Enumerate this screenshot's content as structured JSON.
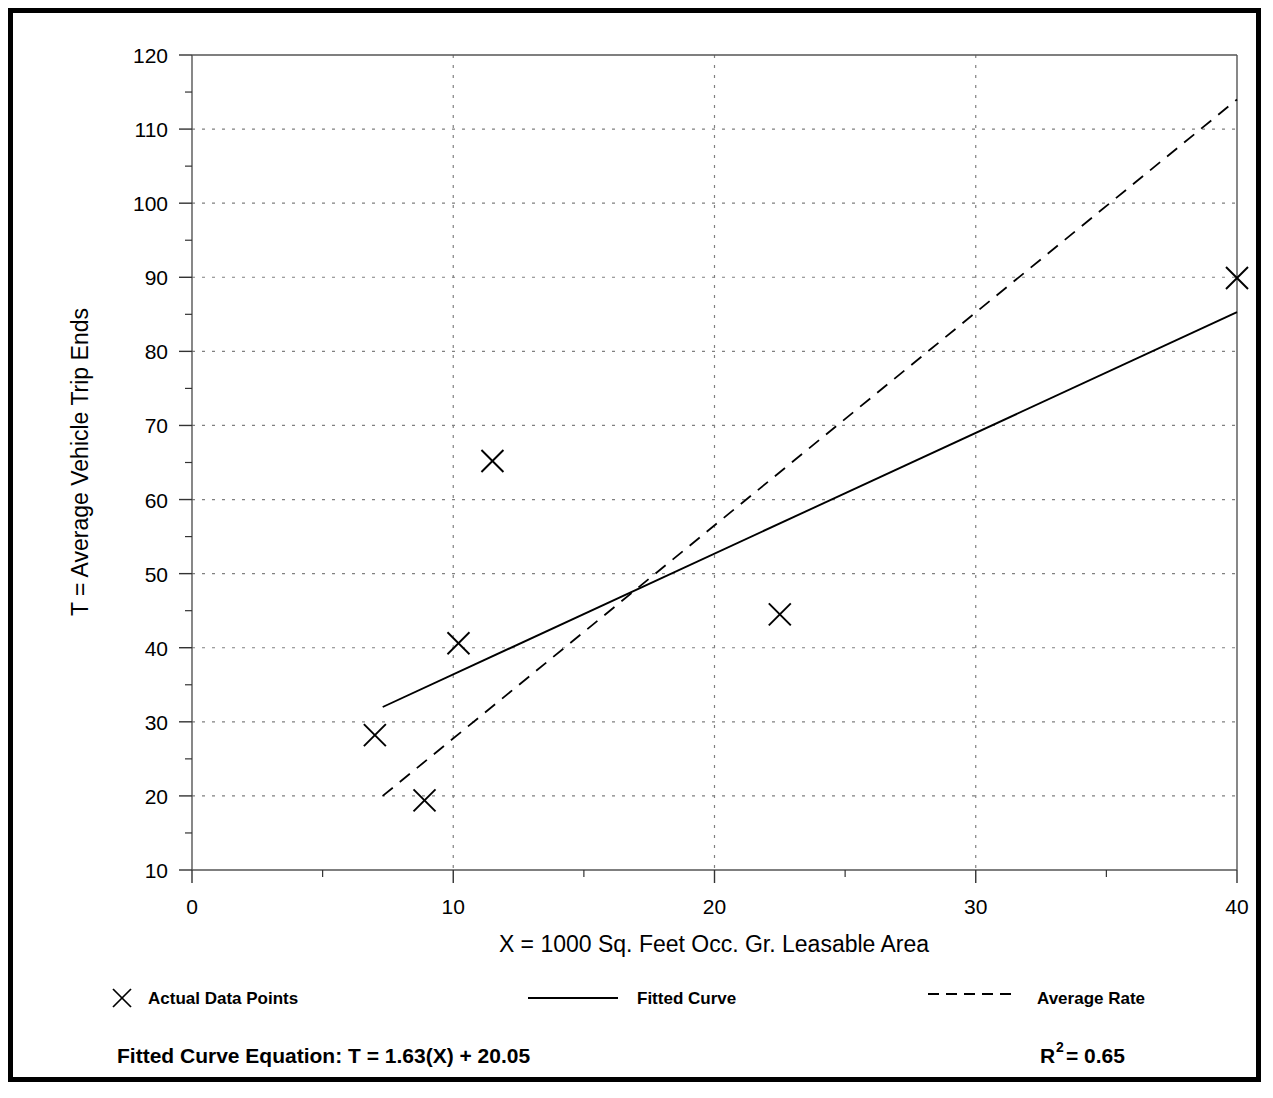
{
  "chart_data": {
    "type": "scatter",
    "title": "",
    "xlabel": "X = 1000 Sq. Feet Occ. Gr. Leasable Area",
    "ylabel": "T = Average Vehicle Trip Ends",
    "xlim": [
      0,
      40
    ],
    "ylim": [
      10,
      120
    ],
    "xticks": [
      0,
      10,
      20,
      30,
      40
    ],
    "xtick_labels": [
      "0",
      "10",
      "20",
      "30",
      "40"
    ],
    "yticks": [
      10,
      20,
      30,
      40,
      50,
      60,
      70,
      80,
      90,
      100,
      110,
      120
    ],
    "ytick_labels": [
      "10",
      "20",
      "30",
      "40",
      "50",
      "60",
      "70",
      "80",
      "90",
      "100",
      "110",
      "120"
    ],
    "y_minor_ticks": [
      15,
      25,
      35,
      45,
      55,
      65,
      75,
      85,
      95,
      105,
      115
    ],
    "x_minor_ticks": [
      5,
      15,
      25,
      35
    ],
    "grid": "dotted-both",
    "grid_color": "#808080",
    "legend_position": "below-axes",
    "points": [
      {
        "x": 7.0,
        "y": 28.2,
        "label": "Actual Data Points"
      },
      {
        "x": 8.9,
        "y": 19.4,
        "label": "Actual Data Points"
      },
      {
        "x": 10.2,
        "y": 40.6,
        "label": "Actual Data Points"
      },
      {
        "x": 11.5,
        "y": 65.2,
        "label": "Actual Data Points"
      },
      {
        "x": 22.5,
        "y": 44.5,
        "label": "Actual Data Points"
      },
      {
        "x": 40.0,
        "y": 89.9,
        "label": "Actual Data Points"
      }
    ],
    "series": [
      {
        "name": "Fitted Curve",
        "style": "solid",
        "slope": 1.63,
        "intercept": 20.05,
        "x_start": 7.3,
        "x_end": 40.0,
        "y_start": 32.0,
        "y_end": 85.3
      },
      {
        "name": "Average Rate",
        "style": "dashed",
        "slope": 2.874,
        "intercept": -1.0,
        "x_start": 7.3,
        "x_end": 40.0,
        "y_start": 20.0,
        "y_end": 114.0
      }
    ],
    "annotations": {
      "equation": "Fitted Curve Equation:  T = 1.63(X) + 20.05",
      "r_squared_base": "R",
      "r_squared_exp": "2",
      "r_squared_value": " = 0.65"
    }
  },
  "legend": {
    "items": [
      {
        "label": "Actual Data Points",
        "marker": "x-marker"
      },
      {
        "label": "Fitted Curve",
        "marker": "solid-line"
      },
      {
        "label": "Average Rate",
        "marker": "dashed-line"
      }
    ]
  },
  "axis": {
    "x_title": "X = 1000 Sq. Feet Occ. Gr. Leasable Area",
    "y_title": "T = Average Vehicle Trip Ends"
  },
  "footer": {
    "equation_label": "Fitted Curve Equation:  T = 1.63(X) + 20.05",
    "r2_label": "R",
    "r2_superscript": "2",
    "r2_value": " = 0.65"
  },
  "colors": {
    "ink": "#000000",
    "grid": "#7a7a7a",
    "frame": "#000000",
    "background": "#ffffff"
  }
}
